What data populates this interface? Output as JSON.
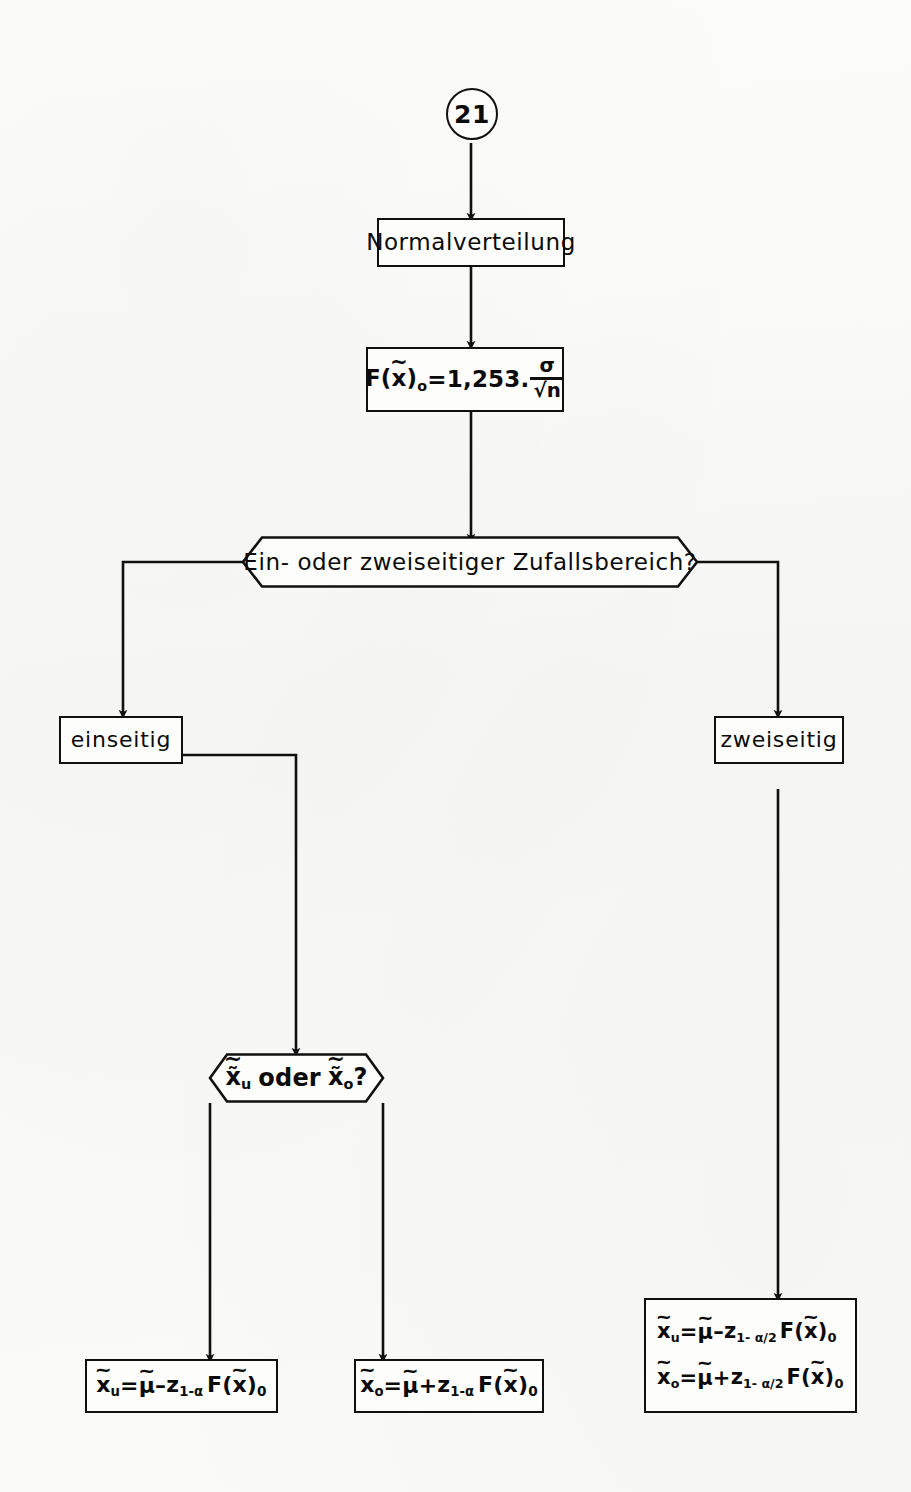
{
  "diagram": {
    "page_connector": "21",
    "nodes": {
      "start": {
        "label": "21",
        "shape": "connector-circle"
      },
      "distribution": {
        "label": "Normalverteilung",
        "shape": "process-box"
      },
      "std_error": {
        "shape": "process-box",
        "formula_plain": "F(x̃)o = 1,253 · σ/√n",
        "lhs": "F(x̃)o",
        "equals": "=",
        "coefficient": "1,253",
        "dot": ".",
        "numerator": "σ",
        "denominator": "√n"
      },
      "decision_sides": {
        "label": "Ein- oder zweiseitiger Zufallsbereich?",
        "shape": "decision-hexagon"
      },
      "one_sided": {
        "label": "einseitig",
        "shape": "process-box"
      },
      "two_sided": {
        "label": "zweiseitig",
        "shape": "process-box"
      },
      "decision_bound": {
        "label_plain": "x̃u oder x̃o?",
        "part_left": "x̃",
        "part_left_sub": "u",
        "part_mid": "oder",
        "part_right": "x̃",
        "part_right_sub": "o",
        "part_end": "?",
        "shape": "decision-hexagon"
      },
      "result_lower": {
        "shape": "process-box",
        "formula_plain": "x̃u = µ̃ − z1-α F(x̃)0",
        "lhs_var": "x",
        "lhs_sub": "u",
        "equals": "=",
        "mu": "µ",
        "sign": "–",
        "z": "z",
        "z_sub": "1-α",
        "fx": "F(x̃)",
        "fx_sub": "0"
      },
      "result_upper": {
        "shape": "process-box",
        "formula_plain": "x̃o = µ̃ + z1-α F(x̃)0",
        "lhs_var": "x",
        "lhs_sub": "o",
        "equals": "=",
        "mu": "µ",
        "sign": "+",
        "z": "z",
        "z_sub": "1-α",
        "fx": "F(x̃)",
        "fx_sub": "0"
      },
      "result_two_sided": {
        "shape": "process-box",
        "line1_plain": "x̃u = µ̃ − z1-α/2 F(x̃)0",
        "line2_plain": "x̃o = µ̃ + z1-α/2 F(x̃)0",
        "line1": {
          "lhs_var": "x",
          "lhs_sub": "u",
          "equals": "=",
          "mu": "µ",
          "sign": "–",
          "z": "z",
          "z_sub": "1- α/2",
          "fx": "F(x̃)",
          "fx_sub": "0"
        },
        "line2": {
          "lhs_var": "x",
          "lhs_sub": "o",
          "equals": "=",
          "mu": "µ",
          "sign": "+",
          "z": "z",
          "z_sub": "1- α/2",
          "fx": "F(x̃)",
          "fx_sub": "0"
        }
      }
    },
    "colors": {
      "ink": "#101010",
      "paper": "#fbfbfa"
    }
  }
}
